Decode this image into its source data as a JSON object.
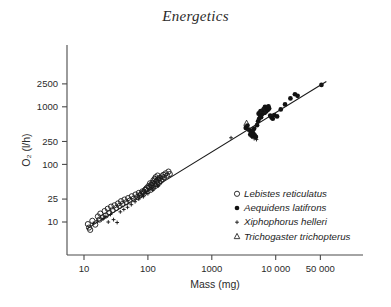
{
  "chart_data": {
    "type": "scatter",
    "title": "Energetics",
    "xlabel": "Mass (mg)",
    "ylabel": "O₂ (l/h)",
    "xscale": "log",
    "yscale": "log",
    "grid": false,
    "xlim": [
      8,
      90000
    ],
    "ylim": [
      6,
      3200
    ],
    "xticks": [
      10,
      100,
      1000,
      10000,
      50000
    ],
    "xtick_labels": [
      "10",
      "100",
      "1000",
      "10 000",
      "50 000"
    ],
    "yticks": [
      10,
      25,
      100,
      250,
      1000,
      2500
    ],
    "ytick_labels": [
      "10",
      "25",
      "100",
      "250",
      "1000",
      "2500"
    ],
    "legend_position": "lower-right",
    "fit_line": {
      "name": "regression line",
      "x_start": 11,
      "y_start": 7.6,
      "x_end": 62000,
      "y_end": 2750
    },
    "series": [
      {
        "name": "Lebistes reticulatus",
        "marker": "open-circle",
        "points": [
          [
            11.5,
            9.2
          ],
          [
            12.0,
            8.0
          ],
          [
            12.5,
            7.3
          ],
          [
            13.5,
            10.5
          ],
          [
            15.0,
            9.0
          ],
          [
            16.5,
            12.5
          ],
          [
            17.5,
            11.0
          ],
          [
            18.0,
            14.0
          ],
          [
            19.5,
            12.0
          ],
          [
            21.0,
            15.5
          ],
          [
            22.0,
            13.0
          ],
          [
            23.5,
            17.0
          ],
          [
            25.0,
            14.5
          ],
          [
            26.5,
            18.5
          ],
          [
            28.0,
            16.0
          ],
          [
            30.0,
            19.5
          ],
          [
            32.0,
            17.5
          ],
          [
            34.0,
            21.0
          ],
          [
            36.0,
            19.0
          ],
          [
            38.0,
            23.0
          ],
          [
            40.0,
            20.5
          ],
          [
            43.0,
            24.5
          ],
          [
            46.0,
            22.0
          ],
          [
            49.0,
            26.0
          ],
          [
            52.0,
            23.5
          ],
          [
            56.0,
            28.0
          ],
          [
            60.0,
            25.5
          ],
          [
            64.0,
            30.0
          ],
          [
            68.0,
            27.0
          ],
          [
            72.0,
            32.0
          ],
          [
            77.0,
            29.5
          ],
          [
            82.0,
            34.0
          ],
          [
            87.0,
            31.5
          ],
          [
            93.0,
            37.0
          ],
          [
            99.0,
            34.5
          ],
          [
            105.0,
            40.0
          ],
          [
            110.0,
            36.0
          ],
          [
            115.0,
            43.0
          ],
          [
            120.0,
            39.0
          ],
          [
            125.0,
            46.0
          ],
          [
            130.0,
            42.0
          ],
          [
            135.0,
            50.0
          ],
          [
            140.0,
            45.0
          ],
          [
            145.0,
            54.0
          ],
          [
            150.0,
            48.0
          ],
          [
            155.0,
            58.0
          ],
          [
            160.0,
            52.0
          ],
          [
            165.0,
            62.0
          ],
          [
            170.0,
            56.0
          ],
          [
            175.0,
            66.0
          ],
          [
            180.0,
            60.0
          ],
          [
            190.0,
            70.0
          ],
          [
            200.0,
            64.0
          ],
          [
            210.0,
            75.0
          ],
          [
            220.0,
            68.0
          ],
          [
            128.0,
            56.0
          ],
          [
            132.0,
            60.0
          ],
          [
            138.0,
            52.0
          ],
          [
            142.0,
            64.0
          ],
          [
            148.0,
            57.0
          ],
          [
            118.0,
            48.0
          ],
          [
            122.0,
            53.0
          ],
          [
            112.0,
            44.0
          ],
          [
            108.0,
            47.0
          ],
          [
            102.0,
            42.0
          ],
          [
            96.0,
            39.0
          ],
          [
            90.0,
            36.0
          ],
          [
            85.0,
            33.0
          ],
          [
            79.0,
            31.0
          ],
          [
            74.0,
            28.5
          ]
        ]
      },
      {
        "name": "Aequidens latifrons",
        "marker": "filled-circle",
        "points": [
          [
            3400,
            430
          ],
          [
            3600,
            470
          ],
          [
            3800,
            400
          ],
          [
            4000,
            330
          ],
          [
            4100,
            360
          ],
          [
            4300,
            310
          ],
          [
            4500,
            340
          ],
          [
            4700,
            320
          ],
          [
            4900,
            300
          ],
          [
            5100,
            480
          ],
          [
            5300,
            560
          ],
          [
            5500,
            620
          ],
          [
            5700,
            700
          ],
          [
            5900,
            660
          ],
          [
            6100,
            740
          ],
          [
            6300,
            800
          ],
          [
            6500,
            860
          ],
          [
            6700,
            780
          ],
          [
            6900,
            900
          ],
          [
            7100,
            830
          ],
          [
            7300,
            950
          ],
          [
            7500,
            880
          ],
          [
            7700,
            1020
          ],
          [
            7900,
            930
          ],
          [
            8200,
            700
          ],
          [
            8600,
            650
          ],
          [
            9000,
            620
          ],
          [
            9500,
            720
          ],
          [
            10500,
            680
          ],
          [
            12000,
            900
          ],
          [
            14000,
            1100
          ],
          [
            17000,
            1400
          ],
          [
            20000,
            1650
          ],
          [
            22000,
            1550
          ],
          [
            52000,
            2400
          ],
          [
            6800,
            1000
          ],
          [
            7000,
            960
          ],
          [
            6600,
            920
          ],
          [
            6400,
            890
          ],
          [
            5800,
            840
          ],
          [
            5600,
            790
          ],
          [
            5400,
            760
          ],
          [
            4600,
            420
          ],
          [
            4400,
            390
          ]
        ]
      },
      {
        "name": "Xiphophorus helleri",
        "marker": "plus",
        "points": [
          [
            14.0,
            9.5
          ],
          [
            16.0,
            10.5
          ],
          [
            18.0,
            5.8
          ],
          [
            20.0,
            11.5
          ],
          [
            22.0,
            12.5
          ],
          [
            24.0,
            10.0
          ],
          [
            26.0,
            13.5
          ],
          [
            29.0,
            11.0
          ],
          [
            33.0,
            9.8
          ],
          [
            37.0,
            15.0
          ],
          [
            42.0,
            16.5
          ],
          [
            48.0,
            18.0
          ],
          [
            55.0,
            20.0
          ],
          [
            63.0,
            22.5
          ],
          [
            72.0,
            25.0
          ],
          [
            85.0,
            27.5
          ],
          [
            100.0,
            31.0
          ],
          [
            120.0,
            36.0
          ],
          [
            145.0,
            42.0
          ],
          [
            2000,
            290
          ],
          [
            4200,
            300
          ],
          [
            4600,
            280
          ],
          [
            5000,
            270
          ]
        ]
      },
      {
        "name": "Trichogaster trichopterus",
        "marker": "triangle",
        "points": [
          [
            3500,
            520
          ],
          [
            6300,
            860
          ]
        ]
      }
    ]
  }
}
